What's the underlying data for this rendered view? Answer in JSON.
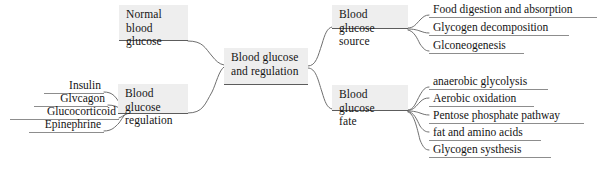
{
  "diagram": {
    "type": "mind-map",
    "title": "Blood glucose and regulation",
    "center": {
      "label": "Blood glucose\nand regulation"
    },
    "branches": {
      "top_left": {
        "label": "Normal blood\nglucose",
        "children": []
      },
      "bottom_left": {
        "label": "Blood glucose\nregulation",
        "children": [
          "Insulin",
          "Glvcagon",
          "Glucocorticoid",
          "Epinephrine"
        ]
      },
      "top_right": {
        "label": "Blood glucose\nsource",
        "children": [
          "Food digestion and absorption",
          "Glycogen decomposition",
          "Glconeogenesis"
        ]
      },
      "bottom_right": {
        "label": "Blood glucose\nfate",
        "children": [
          "anaerobic glycolysis",
          "Aerobic oxidation",
          "Pentose phosphate pathway",
          "fat and amino acids",
          "Glycogen systhesis"
        ]
      }
    },
    "colors": {
      "node_fill": "#eeeeee",
      "node_underline": "#5c5c5c",
      "leaf_underline": "#8d8d8d",
      "connector": "#6f6f6f",
      "text": "#141414",
      "background": "#ffffff"
    }
  }
}
